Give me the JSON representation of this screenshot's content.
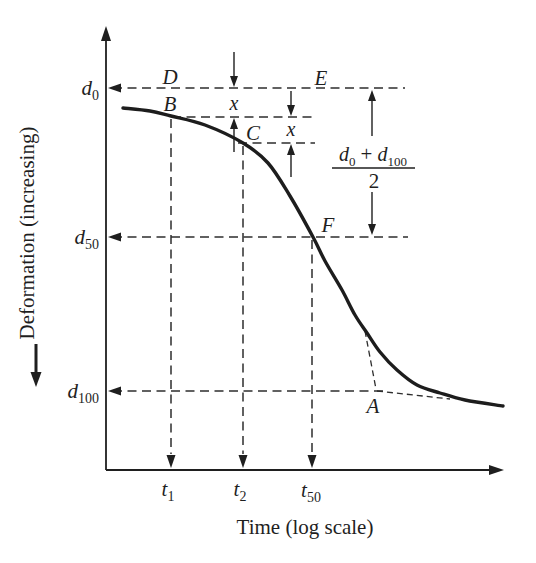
{
  "colors": {
    "ink": "#1f1f1f",
    "dash": "#2e2e2e",
    "curve": "#1d1d1d",
    "background": "#ffffff"
  },
  "xlabel": {
    "text": "Time (log scale)"
  },
  "ylabel": {
    "text": "Deformation (increasing)"
  },
  "axis_labels": {
    "d0": {
      "main": "d",
      "sub": "0"
    },
    "d50": {
      "main": "d",
      "sub": "50"
    },
    "d100": {
      "main": "d",
      "sub": "100"
    },
    "t1": {
      "main": "t",
      "sub": "1"
    },
    "t2": {
      "main": "t",
      "sub": "2"
    },
    "t50": {
      "main": "t",
      "sub": "50"
    }
  },
  "point_labels": {
    "A": "A",
    "B": "B",
    "C": "C",
    "D": "D",
    "E": "E",
    "F": "F"
  },
  "dim_labels": {
    "x1": "x",
    "x2": "x"
  },
  "fraction": {
    "d1": "d",
    "d1_sub": "0",
    "plus": "+",
    "d2": "d",
    "d2_sub": "100",
    "den": "2"
  },
  "chart_data": {
    "type": "line",
    "title": "",
    "xlabel": "Time (log scale)",
    "ylabel": "Deformation (increasing)",
    "x_scale": "log",
    "y_direction": "deformation increases downward",
    "grid": false,
    "legend": false,
    "reference_lines": {
      "horizontal": [
        {
          "label": "d0",
          "y_px": 88
        },
        {
          "label": "d50",
          "y_px": 237
        },
        {
          "label": "d100",
          "y_px": 391
        }
      ],
      "vertical": [
        {
          "label": "t1",
          "x_px": 171
        },
        {
          "label": "t2",
          "x_px": 243
        },
        {
          "label": "t50",
          "x_px": 312
        }
      ],
      "d50_formula": "(d0 + d100) / 2"
    },
    "labeled_points_px": {
      "D": [
        170,
        88
      ],
      "E": [
        320,
        88
      ],
      "B": [
        170,
        116
      ],
      "C": [
        243,
        143
      ],
      "F": [
        313,
        237
      ],
      "A": [
        376,
        390
      ]
    },
    "equal_offsets": [
      {
        "label": "x",
        "from_y_px": 88,
        "to_y_px": 117,
        "at_x_px": 234
      },
      {
        "label": "x",
        "from_y_px": 117,
        "to_y_px": 143,
        "at_x_px": 291
      }
    ],
    "curve_points_px": [
      [
        123,
        108
      ],
      [
        150,
        111
      ],
      [
        171,
        116
      ],
      [
        205,
        125
      ],
      [
        243,
        143
      ],
      [
        268,
        163
      ],
      [
        290,
        196
      ],
      [
        313,
        237
      ],
      [
        325,
        261
      ],
      [
        342,
        290
      ],
      [
        355,
        315
      ],
      [
        367,
        333
      ],
      [
        380,
        352
      ],
      [
        397,
        370
      ],
      [
        417,
        385
      ],
      [
        440,
        393
      ],
      [
        465,
        400
      ],
      [
        503,
        406
      ]
    ],
    "geometry": {
      "axes": {
        "y": [
          106,
          470,
          106,
          40
        ],
        "x": [
          106,
          470,
          490,
          470
        ]
      },
      "axis_arrow_tips": {
        "y_top": [
          106,
          26
        ],
        "x_right": [
          504,
          470
        ]
      },
      "h_guides": [
        {
          "y": 88,
          "x1": 113,
          "x2": 405,
          "arrow": true
        },
        {
          "y": 237,
          "x1": 113,
          "x2": 408,
          "arrow": true
        },
        {
          "y": 391,
          "x1": 113,
          "x2": 383,
          "arrow": true
        },
        {
          "y": 117,
          "x1": 172,
          "x2": 315,
          "arrow": false
        },
        {
          "y": 143,
          "x1": 238,
          "x2": 315,
          "arrow": false
        }
      ],
      "v_guides": [
        {
          "x": 171,
          "y1": 119,
          "y2": 454
        },
        {
          "x": 243,
          "y1": 146,
          "y2": 454
        },
        {
          "x": 312,
          "y1": 240,
          "y2": 454
        }
      ],
      "tangents": [
        [
          365,
          331,
          376,
          389
        ],
        [
          377,
          391,
          450,
          399
        ]
      ],
      "dim_arrows": [
        {
          "x": 234,
          "from": 52,
          "tip": 87,
          "dir": "down"
        },
        {
          "x": 234,
          "from": 152,
          "tip": 118,
          "dir": "up"
        },
        {
          "x": 291,
          "from": 91,
          "tip": 116,
          "dir": "down"
        },
        {
          "x": 291,
          "from": 177,
          "tip": 144,
          "dir": "up"
        },
        {
          "x": 372,
          "from": 136,
          "tip": 90,
          "dir": "up"
        },
        {
          "x": 372,
          "from": 192,
          "tip": 235,
          "dir": "down"
        }
      ],
      "ylabel_arrow": {
        "x": 36,
        "y1": 344,
        "y2": 373,
        "tip": 387
      },
      "fraction_bar": [
        332,
        168,
        415,
        168
      ]
    }
  }
}
